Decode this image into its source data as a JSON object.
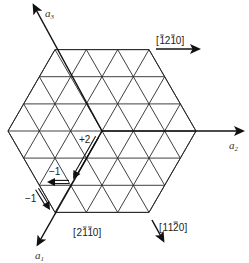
{
  "diagram": {
    "type": "hexagonal-lattice-basal-plane",
    "hexagon": {
      "center": [
        102,
        131
      ],
      "vertex_radius": 94,
      "divisions": 3
    },
    "axes": [
      {
        "id": "a1",
        "label": "a",
        "subscript": "1",
        "from": [
          102,
          131
        ],
        "to": [
          38,
          244
        ],
        "label_pos": [
          36,
          259
        ]
      },
      {
        "id": "a2",
        "label": "a",
        "subscript": "2",
        "from": [
          102,
          131
        ],
        "to": [
          242,
          131
        ],
        "label_pos": [
          230,
          148
        ]
      },
      {
        "id": "a3",
        "label": "a",
        "subscript": "3",
        "from": [
          102,
          131
        ],
        "to": [
          34,
          6
        ],
        "label_pos": [
          45,
          17
        ]
      }
    ],
    "directions": [
      {
        "id": "dir-m1210",
        "label": "[̅1 2 ̅1 0]",
        "display": "[1̅2 1̅0]",
        "from": [
          156,
          49
        ],
        "to": [
          198,
          49
        ],
        "label_pos": [
          155,
          44
        ]
      },
      {
        "id": "dir-11m20",
        "label": "[1 1 ̅2 0]",
        "display": "[11̅2 0]",
        "from": [
          152,
          220
        ],
        "to": [
          163,
          240
        ],
        "label_pos": [
          158,
          230
        ]
      },
      {
        "id": "dir-2m1m10",
        "label": "[2 ̅1 ̅1 0]",
        "display": "[2̅1̅1 0]",
        "from": null,
        "to": null,
        "label_pos": [
          73,
          236
        ]
      }
    ],
    "direction_labels": {
      "top": "[̅1 2 ̅1 0]",
      "bottom_right": "[1 1 ̅2 0]",
      "bottom_left": "[2 ̅1 ̅1 0]"
    },
    "labels_text": {
      "top": [
        "[",
        "1",
        "2",
        "1",
        "0",
        "]"
      ],
      "top_bars": [
        1,
        3
      ],
      "bottom_right": [
        "[",
        "1",
        "1",
        "2",
        "0",
        "]"
      ],
      "bottom_right_bars": [
        3
      ],
      "bottom_left": [
        "[",
        "2",
        "1",
        "1",
        "0",
        "]"
      ],
      "bottom_left_bars": [
        2,
        3
      ]
    },
    "component_vectors": [
      {
        "id": "plus2",
        "label": "+2",
        "from": [
          97,
          137
        ],
        "to": [
          73,
          179
        ],
        "label_pos": [
          80,
          144
        ]
      },
      {
        "id": "minus1-a2",
        "label": "−1",
        "from": [
          69,
          182
        ],
        "to": [
          47,
          182
        ],
        "label_pos": [
          50,
          177
        ]
      },
      {
        "id": "minus1-a3",
        "label": "−1",
        "from": [
          37,
          189
        ],
        "to": [
          50,
          210
        ],
        "label_pos": [
          24,
          202
        ]
      }
    ],
    "colors": {
      "line": "#2a2a2a",
      "arrow": "#111111",
      "text": "#222222",
      "background": "#ffffff"
    }
  }
}
